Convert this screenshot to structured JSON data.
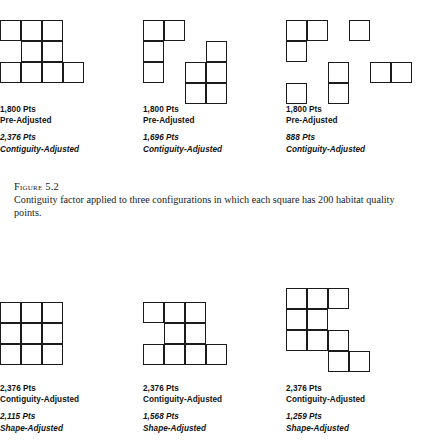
{
  "figure": {
    "number_label": "Figure 5.2",
    "number_prefix": "F",
    "number_rest": "IGURE",
    "number_value": "5.2",
    "caption": "Contiguity factor applied to three configurations in which each square has 200 habitat quality points."
  },
  "cell_size": 21,
  "top_row": [
    {
      "id": "config-a",
      "art": {
        "cols": 4,
        "rows": 3,
        "cells": [
          [
            0,
            0
          ],
          [
            1,
            0
          ],
          [
            2,
            0
          ],
          [
            1,
            1
          ],
          [
            2,
            1
          ],
          [
            0,
            2
          ],
          [
            1,
            2
          ],
          [
            2,
            2
          ],
          [
            3,
            2
          ]
        ]
      },
      "labels": {
        "pre_value": "1,800 Pts",
        "pre_caption": "Pre-Adjusted",
        "adj_value": "2,376 Pts",
        "adj_caption": "Contiguity-Adjusted"
      }
    },
    {
      "id": "config-b",
      "art": {
        "cols": 4,
        "rows": 4,
        "cells": [
          [
            0,
            0
          ],
          [
            1,
            0
          ],
          [
            0,
            1
          ],
          [
            3,
            1
          ],
          [
            0,
            2
          ],
          [
            2,
            2
          ],
          [
            3,
            2
          ],
          [
            2,
            3
          ],
          [
            3,
            3
          ]
        ]
      },
      "labels": {
        "pre_value": "1,800 Pts",
        "pre_caption": "Pre-Adjusted",
        "adj_value": "1,696 Pts",
        "adj_caption": "Contiguity-Adjusted"
      }
    },
    {
      "id": "config-c",
      "art": {
        "cols": 6,
        "rows": 4,
        "cells": [
          [
            0,
            0
          ],
          [
            1,
            0
          ],
          [
            3,
            0
          ],
          [
            0,
            1
          ],
          [
            0,
            3
          ],
          [
            2,
            2
          ],
          [
            2,
            3
          ],
          [
            4,
            2
          ],
          [
            5,
            2
          ]
        ]
      },
      "labels": {
        "pre_value": "1,800 Pts",
        "pre_caption": "Pre-Adjusted",
        "adj_value": "888 Pts",
        "adj_caption": "Contiguity-Adjusted"
      }
    }
  ],
  "bottom_row": [
    {
      "id": "shape-a",
      "art": {
        "cols": 3,
        "rows": 3,
        "cells": [
          [
            0,
            0
          ],
          [
            1,
            0
          ],
          [
            2,
            0
          ],
          [
            0,
            1
          ],
          [
            1,
            1
          ],
          [
            2,
            1
          ],
          [
            0,
            2
          ],
          [
            1,
            2
          ],
          [
            2,
            2
          ]
        ]
      },
      "labels": {
        "pre_value": "2,376 Pts",
        "pre_caption": "Contiguity-Adjusted",
        "adj_value": "2,115 Pts",
        "adj_caption": "Shape-Adjusted"
      }
    },
    {
      "id": "shape-b",
      "art": {
        "cols": 4,
        "rows": 3,
        "cells": [
          [
            0,
            0
          ],
          [
            1,
            0
          ],
          [
            2,
            0
          ],
          [
            1,
            1
          ],
          [
            2,
            1
          ],
          [
            0,
            2
          ],
          [
            1,
            2
          ],
          [
            2,
            2
          ],
          [
            3,
            2
          ]
        ]
      },
      "labels": {
        "pre_value": "2,376 Pts",
        "pre_caption": "Contiguity-Adjusted",
        "adj_value": "1,568 Pts",
        "adj_caption": "Shape-Adjusted"
      }
    },
    {
      "id": "shape-c",
      "art": {
        "cols": 4,
        "rows": 4,
        "cells": [
          [
            0,
            0
          ],
          [
            1,
            0
          ],
          [
            2,
            0
          ],
          [
            0,
            1
          ],
          [
            1,
            1
          ],
          [
            0,
            2
          ],
          [
            1,
            2
          ],
          [
            2,
            2
          ],
          [
            2,
            3
          ],
          [
            3,
            3
          ]
        ]
      },
      "labels": {
        "pre_value": "2,376 Pts",
        "pre_caption": "Contiguity-Adjusted",
        "adj_value": "1,259 Pts",
        "adj_caption": "Shape-Adjusted"
      }
    }
  ]
}
